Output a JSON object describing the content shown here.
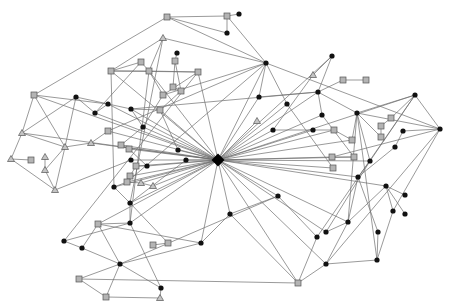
{
  "diagram": {
    "type": "network-graph",
    "width": 450,
    "height": 302,
    "colors": {
      "edge": "#6e6e6e",
      "circle": "#111111",
      "square": "#b4b4b4",
      "triangle": "#c4c4c4",
      "outline": "#555555"
    },
    "nodes": [
      {
        "id": "hub",
        "shape": "hub",
        "x": 218,
        "y": 160
      },
      {
        "id": "s1",
        "shape": "square",
        "x": 167,
        "y": 17
      },
      {
        "id": "s2",
        "shape": "square",
        "x": 227,
        "y": 16
      },
      {
        "id": "c1",
        "shape": "circle",
        "x": 239,
        "y": 14
      },
      {
        "id": "c2",
        "shape": "circle",
        "x": 227,
        "y": 33
      },
      {
        "id": "c3",
        "shape": "circle",
        "x": 266,
        "y": 63
      },
      {
        "id": "t1",
        "shape": "triangle",
        "x": 163,
        "y": 38
      },
      {
        "id": "c4",
        "shape": "circle",
        "x": 177,
        "y": 53
      },
      {
        "id": "s3",
        "shape": "square",
        "x": 175,
        "y": 61
      },
      {
        "id": "s4",
        "shape": "square",
        "x": 141,
        "y": 62
      },
      {
        "id": "s5",
        "shape": "square",
        "x": 111,
        "y": 71
      },
      {
        "id": "s6",
        "shape": "square",
        "x": 149,
        "y": 71
      },
      {
        "id": "s7",
        "shape": "square",
        "x": 198,
        "y": 72
      },
      {
        "id": "s8",
        "shape": "square",
        "x": 173,
        "y": 87
      },
      {
        "id": "s9",
        "shape": "square",
        "x": 181,
        "y": 91
      },
      {
        "id": "s10",
        "shape": "square",
        "x": 163,
        "y": 95
      },
      {
        "id": "c5",
        "shape": "circle",
        "x": 332,
        "y": 56
      },
      {
        "id": "t2",
        "shape": "triangle",
        "x": 313,
        "y": 75
      },
      {
        "id": "s11",
        "shape": "square",
        "x": 343,
        "y": 80
      },
      {
        "id": "s12",
        "shape": "square",
        "x": 366,
        "y": 80
      },
      {
        "id": "c6",
        "shape": "circle",
        "x": 318,
        "y": 92
      },
      {
        "id": "c7",
        "shape": "circle",
        "x": 259,
        "y": 97
      },
      {
        "id": "c8",
        "shape": "circle",
        "x": 287,
        "y": 104
      },
      {
        "id": "c9",
        "shape": "circle",
        "x": 322,
        "y": 115
      },
      {
        "id": "c10",
        "shape": "circle",
        "x": 357,
        "y": 113
      },
      {
        "id": "c11",
        "shape": "circle",
        "x": 415,
        "y": 95
      },
      {
        "id": "c12",
        "shape": "circle",
        "x": 440,
        "y": 129
      },
      {
        "id": "s13",
        "shape": "square",
        "x": 391,
        "y": 118
      },
      {
        "id": "s14",
        "shape": "square",
        "x": 381,
        "y": 126
      },
      {
        "id": "s15",
        "shape": "square",
        "x": 381,
        "y": 137
      },
      {
        "id": "c13",
        "shape": "circle",
        "x": 403,
        "y": 131
      },
      {
        "id": "c14",
        "shape": "circle",
        "x": 395,
        "y": 147
      },
      {
        "id": "s16",
        "shape": "square",
        "x": 334,
        "y": 130
      },
      {
        "id": "s17",
        "shape": "square",
        "x": 352,
        "y": 140
      },
      {
        "id": "c15",
        "shape": "circle",
        "x": 313,
        "y": 130
      },
      {
        "id": "c16",
        "shape": "circle",
        "x": 273,
        "y": 130
      },
      {
        "id": "t3",
        "shape": "triangle",
        "x": 257,
        "y": 121
      },
      {
        "id": "s18",
        "shape": "square",
        "x": 332,
        "y": 157
      },
      {
        "id": "s19",
        "shape": "square",
        "x": 354,
        "y": 157
      },
      {
        "id": "s20",
        "shape": "square",
        "x": 333,
        "y": 168
      },
      {
        "id": "c17",
        "shape": "circle",
        "x": 370,
        "y": 161
      },
      {
        "id": "c18",
        "shape": "circle",
        "x": 358,
        "y": 177
      },
      {
        "id": "c19",
        "shape": "circle",
        "x": 386,
        "y": 186
      },
      {
        "id": "c20",
        "shape": "circle",
        "x": 405,
        "y": 195
      },
      {
        "id": "c21",
        "shape": "circle",
        "x": 405,
        "y": 214
      },
      {
        "id": "c22",
        "shape": "circle",
        "x": 393,
        "y": 211
      },
      {
        "id": "c23",
        "shape": "circle",
        "x": 348,
        "y": 222
      },
      {
        "id": "c24",
        "shape": "circle",
        "x": 378,
        "y": 232
      },
      {
        "id": "c25",
        "shape": "circle",
        "x": 377,
        "y": 260
      },
      {
        "id": "c26",
        "shape": "circle",
        "x": 326,
        "y": 232
      },
      {
        "id": "c27",
        "shape": "circle",
        "x": 317,
        "y": 237
      },
      {
        "id": "c28",
        "shape": "circle",
        "x": 278,
        "y": 196
      },
      {
        "id": "c29",
        "shape": "circle",
        "x": 230,
        "y": 214
      },
      {
        "id": "c30",
        "shape": "circle",
        "x": 201,
        "y": 243
      },
      {
        "id": "c31",
        "shape": "circle",
        "x": 326,
        "y": 264
      },
      {
        "id": "s21",
        "shape": "square",
        "x": 298,
        "y": 283
      },
      {
        "id": "c32",
        "shape": "circle",
        "x": 186,
        "y": 160
      },
      {
        "id": "c33",
        "shape": "circle",
        "x": 178,
        "y": 150
      },
      {
        "id": "c34",
        "shape": "circle",
        "x": 131,
        "y": 160
      },
      {
        "id": "c35",
        "shape": "circle",
        "x": 131,
        "y": 109
      },
      {
        "id": "c36",
        "shape": "circle",
        "x": 108,
        "y": 104
      },
      {
        "id": "c37",
        "shape": "circle",
        "x": 95,
        "y": 113
      },
      {
        "id": "c38",
        "shape": "circle",
        "x": 76,
        "y": 97
      },
      {
        "id": "c39",
        "shape": "circle",
        "x": 143,
        "y": 127
      },
      {
        "id": "s22",
        "shape": "square",
        "x": 160,
        "y": 110
      },
      {
        "id": "s23",
        "shape": "square",
        "x": 108,
        "y": 131
      },
      {
        "id": "s24",
        "shape": "square",
        "x": 121,
        "y": 145
      },
      {
        "id": "s25",
        "shape": "square",
        "x": 129,
        "y": 149
      },
      {
        "id": "s26",
        "shape": "square",
        "x": 136,
        "y": 166
      },
      {
        "id": "s27",
        "shape": "square",
        "x": 130,
        "y": 176
      },
      {
        "id": "s28",
        "shape": "square",
        "x": 127,
        "y": 182
      },
      {
        "id": "c40",
        "shape": "circle",
        "x": 147,
        "y": 166
      },
      {
        "id": "t4",
        "shape": "triangle",
        "x": 141,
        "y": 183
      },
      {
        "id": "t5",
        "shape": "triangle",
        "x": 153,
        "y": 186
      },
      {
        "id": "c41",
        "shape": "circle",
        "x": 114,
        "y": 187
      },
      {
        "id": "c42",
        "shape": "circle",
        "x": 130,
        "y": 203
      },
      {
        "id": "c43",
        "shape": "circle",
        "x": 130,
        "y": 223
      },
      {
        "id": "s29",
        "shape": "square",
        "x": 98,
        "y": 224
      },
      {
        "id": "s30",
        "shape": "square",
        "x": 153,
        "y": 245
      },
      {
        "id": "s31",
        "shape": "square",
        "x": 168,
        "y": 243
      },
      {
        "id": "c44",
        "shape": "circle",
        "x": 64,
        "y": 241
      },
      {
        "id": "c45",
        "shape": "circle",
        "x": 82,
        "y": 248
      },
      {
        "id": "c46",
        "shape": "circle",
        "x": 120,
        "y": 264
      },
      {
        "id": "s32",
        "shape": "square",
        "x": 79,
        "y": 279
      },
      {
        "id": "s33",
        "shape": "square",
        "x": 106,
        "y": 297
      },
      {
        "id": "c47",
        "shape": "circle",
        "x": 161,
        "y": 288
      },
      {
        "id": "t6",
        "shape": "triangle",
        "x": 160,
        "y": 298
      },
      {
        "id": "s34",
        "shape": "square",
        "x": 34,
        "y": 95
      },
      {
        "id": "t7",
        "shape": "triangle",
        "x": 22,
        "y": 133
      },
      {
        "id": "t8",
        "shape": "triangle",
        "x": 65,
        "y": 147
      },
      {
        "id": "t9",
        "shape": "triangle",
        "x": 91,
        "y": 143
      },
      {
        "id": "t10",
        "shape": "triangle",
        "x": 11,
        "y": 159
      },
      {
        "id": "s35",
        "shape": "square",
        "x": 31,
        "y": 160
      },
      {
        "id": "t11",
        "shape": "triangle",
        "x": 45,
        "y": 157
      },
      {
        "id": "t12",
        "shape": "triangle",
        "x": 45,
        "y": 170
      },
      {
        "id": "t13",
        "shape": "triangle",
        "x": 55,
        "y": 190
      }
    ],
    "edges": [
      [
        "s1",
        "s2"
      ],
      [
        "s2",
        "c1"
      ],
      [
        "s2",
        "c2"
      ],
      [
        "s2",
        "c3"
      ],
      [
        "c2",
        "s1"
      ],
      [
        "s1",
        "s34"
      ],
      [
        "s1",
        "c3"
      ],
      [
        "t1",
        "s5"
      ],
      [
        "t1",
        "s6"
      ],
      [
        "t1",
        "c3"
      ],
      [
        "c4",
        "s3"
      ],
      [
        "s3",
        "s8"
      ],
      [
        "s3",
        "s9"
      ],
      [
        "s5",
        "s6"
      ],
      [
        "s5",
        "s7"
      ],
      [
        "s6",
        "s7"
      ],
      [
        "s5",
        "s4"
      ],
      [
        "s6",
        "s10"
      ],
      [
        "s7",
        "s10"
      ],
      [
        "c3",
        "c7"
      ],
      [
        "c3",
        "c8"
      ],
      [
        "c3",
        "s10"
      ],
      [
        "c3",
        "c12"
      ],
      [
        "c3",
        "hub"
      ],
      [
        "c3",
        "s23"
      ],
      [
        "c5",
        "t2"
      ],
      [
        "c5",
        "c6"
      ],
      [
        "c5",
        "hub"
      ],
      [
        "s11",
        "s12"
      ],
      [
        "s11",
        "c6"
      ],
      [
        "c6",
        "c9"
      ],
      [
        "c6",
        "c10"
      ],
      [
        "c6",
        "hub"
      ],
      [
        "c6",
        "c7"
      ],
      [
        "c6",
        "c35"
      ],
      [
        "c11",
        "c12"
      ],
      [
        "c11",
        "c10"
      ],
      [
        "c11",
        "hub"
      ],
      [
        "c11",
        "c17"
      ],
      [
        "c11",
        "s13"
      ],
      [
        "c12",
        "c10"
      ],
      [
        "c12",
        "s18"
      ],
      [
        "c12",
        "c13"
      ],
      [
        "c12",
        "c22"
      ],
      [
        "c10",
        "c17"
      ],
      [
        "c10",
        "s17"
      ],
      [
        "c10",
        "c25"
      ],
      [
        "c10",
        "c23"
      ],
      [
        "s13",
        "s14"
      ],
      [
        "s14",
        "s15"
      ],
      [
        "s15",
        "c10"
      ],
      [
        "c13",
        "c14"
      ],
      [
        "c14",
        "c18"
      ],
      [
        "c7",
        "hub"
      ],
      [
        "c8",
        "hub"
      ],
      [
        "c9",
        "hub"
      ],
      [
        "c16",
        "hub"
      ],
      [
        "c15",
        "hub"
      ],
      [
        "t3",
        "hub"
      ],
      [
        "s16",
        "hub"
      ],
      [
        "s17",
        "hub"
      ],
      [
        "s18",
        "hub"
      ],
      [
        "s19",
        "hub"
      ],
      [
        "s20",
        "hub"
      ],
      [
        "c17",
        "hub"
      ],
      [
        "c18",
        "hub"
      ],
      [
        "c19",
        "hub"
      ],
      [
        "c23",
        "hub"
      ],
      [
        "c26",
        "hub"
      ],
      [
        "c28",
        "hub"
      ],
      [
        "c29",
        "hub"
      ],
      [
        "c30",
        "hub"
      ],
      [
        "c31",
        "hub"
      ],
      [
        "s21",
        "hub"
      ],
      [
        "c32",
        "hub"
      ],
      [
        "c33",
        "hub"
      ],
      [
        "c34",
        "hub"
      ],
      [
        "c35",
        "hub"
      ],
      [
        "c36",
        "hub"
      ],
      [
        "c37",
        "hub"
      ],
      [
        "c39",
        "hub"
      ],
      [
        "s22",
        "hub"
      ],
      [
        "s23",
        "hub"
      ],
      [
        "s24",
        "hub"
      ],
      [
        "s25",
        "hub"
      ],
      [
        "s26",
        "hub"
      ],
      [
        "s27",
        "hub"
      ],
      [
        "s28",
        "hub"
      ],
      [
        "c40",
        "hub"
      ],
      [
        "t4",
        "hub"
      ],
      [
        "t5",
        "hub"
      ],
      [
        "c41",
        "hub"
      ],
      [
        "c42",
        "hub"
      ],
      [
        "c43",
        "hub"
      ],
      [
        "s29",
        "hub"
      ],
      [
        "s34",
        "hub"
      ],
      [
        "t7",
        "hub"
      ],
      [
        "t9",
        "hub"
      ],
      [
        "s6",
        "hub"
      ],
      [
        "s5",
        "hub"
      ],
      [
        "s7",
        "hub"
      ],
      [
        "c17",
        "c18"
      ],
      [
        "c18",
        "c23"
      ],
      [
        "c18",
        "c24"
      ],
      [
        "c24",
        "c25"
      ],
      [
        "c25",
        "c31"
      ],
      [
        "c19",
        "c20"
      ],
      [
        "c19",
        "c21"
      ],
      [
        "c19",
        "c22"
      ],
      [
        "c19",
        "c23"
      ],
      [
        "c28",
        "c27"
      ],
      [
        "c28",
        "c29"
      ],
      [
        "c29",
        "c30"
      ],
      [
        "c30",
        "c46"
      ],
      [
        "c27",
        "s21"
      ],
      [
        "c26",
        "c23"
      ],
      [
        "c29",
        "s21"
      ],
      [
        "s21",
        "s32"
      ],
      [
        "s21",
        "c31"
      ],
      [
        "s30",
        "s31"
      ],
      [
        "s31",
        "c42"
      ],
      [
        "c43",
        "c44"
      ],
      [
        "c44",
        "c45"
      ],
      [
        "c45",
        "c46"
      ],
      [
        "c46",
        "s32"
      ],
      [
        "c46",
        "s33"
      ],
      [
        "c46",
        "c47"
      ],
      [
        "c47",
        "t6"
      ],
      [
        "s33",
        "t6"
      ],
      [
        "s32",
        "s33"
      ],
      [
        "c43",
        "s29"
      ],
      [
        "c43",
        "c42"
      ],
      [
        "c43",
        "c47"
      ],
      [
        "s29",
        "c45"
      ],
      [
        "s29",
        "c46"
      ],
      [
        "s34",
        "t7"
      ],
      [
        "s34",
        "t8"
      ],
      [
        "s34",
        "c36"
      ],
      [
        "t7",
        "t10"
      ],
      [
        "t7",
        "t8"
      ],
      [
        "t7",
        "c38"
      ],
      [
        "t8",
        "t9"
      ],
      [
        "t8",
        "t12"
      ],
      [
        "t8",
        "t13"
      ],
      [
        "t8",
        "c38"
      ],
      [
        "t10",
        "s35"
      ],
      [
        "t10",
        "t13"
      ],
      [
        "t11",
        "t12"
      ],
      [
        "t12",
        "t13"
      ],
      [
        "t13",
        "c34"
      ],
      [
        "t9",
        "s23"
      ],
      [
        "c36",
        "c37"
      ],
      [
        "c37",
        "c38"
      ],
      [
        "c38",
        "c35"
      ],
      [
        "c35",
        "s22"
      ],
      [
        "c35",
        "c39"
      ],
      [
        "c39",
        "s24"
      ],
      [
        "s24",
        "s25"
      ],
      [
        "s25",
        "c40"
      ],
      [
        "c40",
        "s26"
      ],
      [
        "s26",
        "s27"
      ],
      [
        "s27",
        "s28"
      ],
      [
        "s28",
        "t4"
      ],
      [
        "t4",
        "t5"
      ],
      [
        "c41",
        "c42"
      ],
      [
        "c41",
        "s28"
      ],
      [
        "s4",
        "c37"
      ],
      [
        "s4",
        "s6"
      ],
      [
        "s10",
        "c39"
      ],
      [
        "s8",
        "s9"
      ],
      [
        "s9",
        "s22"
      ],
      [
        "t1",
        "c42"
      ],
      [
        "s5",
        "c41"
      ],
      [
        "s6",
        "c43"
      ],
      [
        "s7",
        "c44"
      ],
      [
        "t2",
        "c16"
      ],
      [
        "c16",
        "c15"
      ],
      [
        "c15",
        "s16"
      ],
      [
        "s16",
        "s17"
      ],
      [
        "c9",
        "s19"
      ],
      [
        "c8",
        "s20"
      ],
      [
        "s18",
        "s19"
      ],
      [
        "c3",
        "s28"
      ],
      [
        "c12",
        "c31"
      ],
      [
        "c11",
        "c27"
      ],
      [
        "c17",
        "c26"
      ],
      [
        "c30",
        "s29"
      ],
      [
        "c28",
        "c46"
      ],
      [
        "c23",
        "c31"
      ],
      [
        "c22",
        "c25"
      ],
      [
        "c32",
        "c42"
      ],
      [
        "c33",
        "s22"
      ]
    ]
  }
}
